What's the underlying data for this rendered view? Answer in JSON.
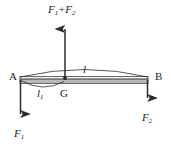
{
  "figure": {
    "kind": "free-body-diagram",
    "colors": {
      "stroke": "#2b2b2b",
      "bar_fill": "#b9b9b9",
      "bar_top_fill": "#f2f2f2",
      "background": "#ffffff",
      "text": "#1a1a1a"
    },
    "bar": {
      "label_left": "A",
      "label_right": "B",
      "label_centroid": "G"
    },
    "dimensions": [
      {
        "name": "total-length",
        "symbol": "l",
        "sub": ""
      },
      {
        "name": "left-segment-length",
        "symbol": "l",
        "sub": "1"
      }
    ],
    "forces": [
      {
        "name": "resultant-force",
        "direction": "up",
        "base": "F",
        "sub1": "1",
        "op": "+",
        "base2": "F",
        "sub2": "2"
      },
      {
        "name": "left-force",
        "direction": "down",
        "base": "F",
        "sub": "1"
      },
      {
        "name": "right-force",
        "direction": "down",
        "base": "F",
        "sub": "2"
      }
    ],
    "labels": {
      "resultant_base1": "F",
      "resultant_sub1": "1",
      "resultant_op": "+",
      "resultant_base2": "F",
      "resultant_sub2": "2",
      "point_a": "A",
      "point_b": "B",
      "point_g": "G",
      "length_total": "l",
      "length_left_base": "l",
      "length_left_sub": "1",
      "force_left_base": "F",
      "force_left_sub": "1",
      "force_right_base": "F",
      "force_right_sub": "2"
    }
  }
}
